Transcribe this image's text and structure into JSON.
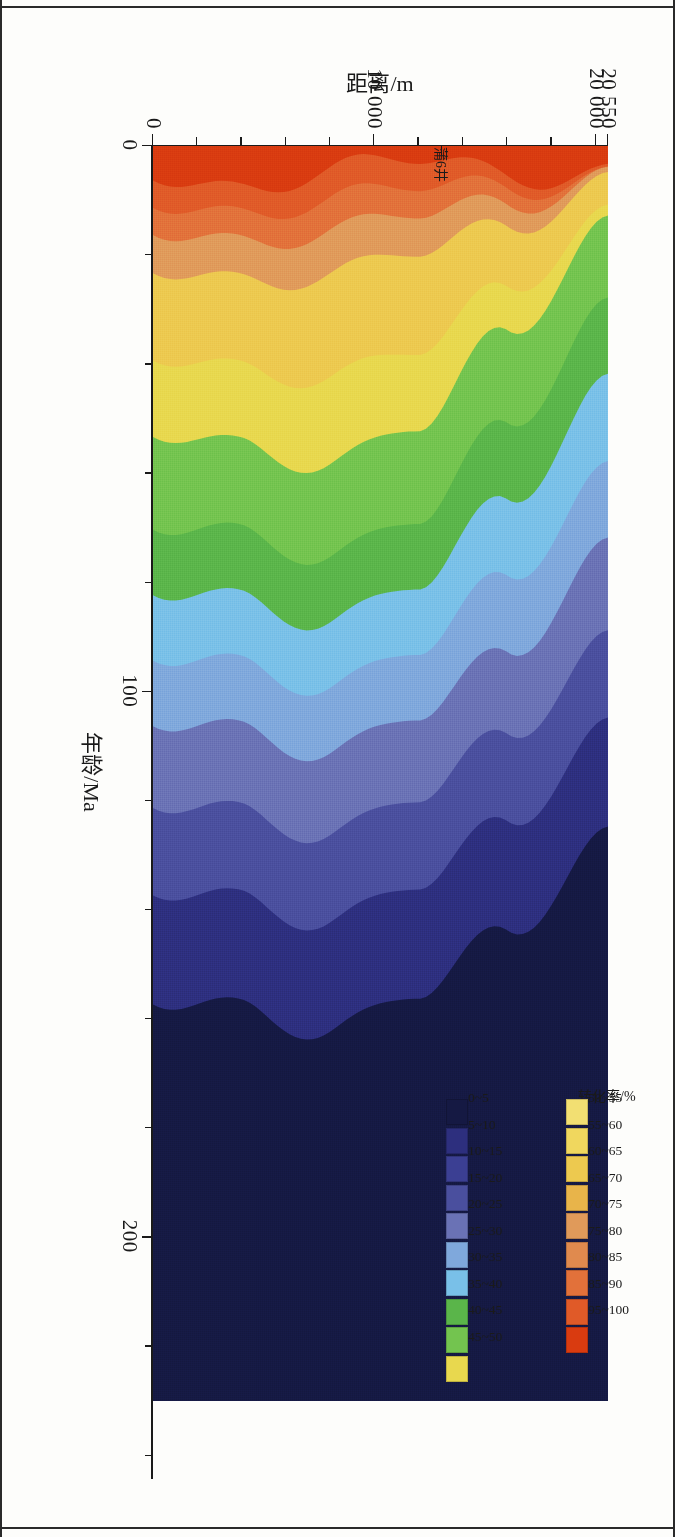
{
  "figure": {
    "type": "filled-contour",
    "well_marker_label": "蒲6井"
  },
  "axes": {
    "x": {
      "title": "年龄/Ma",
      "tick_labels": [
        "0",
        "100",
        "200"
      ],
      "tick_values": [
        0,
        100,
        200
      ],
      "range": [
        0,
        230
      ],
      "minor_step": 20
    },
    "y": {
      "title": "距离/m",
      "tick_labels": [
        "0",
        "10 000",
        "20 000",
        "20 550"
      ],
      "tick_values": [
        0,
        10000,
        20000,
        20550
      ],
      "range": [
        0,
        20550
      ],
      "minor_step": 2000
    }
  },
  "legend": {
    "title": "转化率/%",
    "row_top": {
      "labels": [
        "50~55",
        "55~60",
        "60~65",
        "65~70",
        "70~75",
        "75~80",
        "80~85",
        "85~90",
        "95~100"
      ],
      "colors": [
        "#f2df72",
        "#f0d75e",
        "#edc94f",
        "#e8b44a",
        "#e09a5a",
        "#e08a4e",
        "#e2713a",
        "#e05a28",
        "#d93b10"
      ]
    },
    "row_bottom": {
      "labels": [
        "0~5",
        "5~10",
        "10~15",
        "15~20",
        "20~25",
        "25~30",
        "30~35",
        "35~40",
        "40~45",
        "45~50"
      ],
      "colors": [
        "#151943",
        "#2d2f7e",
        "#3b3f93",
        "#4a4f9e",
        "#6a72b5",
        "#7fa8dc",
        "#79c0e8",
        "#5ab54a",
        "#73c44f",
        "#e8d84e"
      ]
    }
  },
  "chart_data": {
    "type": "heatmap",
    "title": "",
    "xlabel": "年龄/Ma",
    "ylabel": "距离/m",
    "zlabel": "转化率/%",
    "xlim": [
      0,
      230
    ],
    "ylim": [
      0,
      20550
    ],
    "grid": false,
    "legend_position": "top-right",
    "contour_levels": [
      0,
      5,
      10,
      15,
      20,
      25,
      30,
      35,
      40,
      45,
      50,
      55,
      60,
      65,
      70,
      75,
      80,
      85,
      90,
      95,
      100
    ],
    "level_colors": [
      "#151943",
      "#2d2f7e",
      "#3b3f93",
      "#4a4f9e",
      "#6a72b5",
      "#7fa8dc",
      "#79c0e8",
      "#5ab54a",
      "#73c44f",
      "#e8d84e",
      "#f2df72",
      "#f0d75e",
      "#edc94f",
      "#e8b44a",
      "#e09a5a",
      "#e08a4e",
      "#e2713a",
      "#e05a28",
      "#d93b10"
    ],
    "bands": [
      {
        "level": "95~100",
        "color": "#d93b10",
        "x_center_at_y": [
          [
            0,
            2.5
          ],
          [
            4000,
            2.0
          ],
          [
            8000,
            3.0
          ],
          [
            12000,
            2.5
          ],
          [
            16000,
            1.2
          ],
          [
            20550,
            0.0
          ]
        ],
        "half_width": 2.5
      },
      {
        "level": "85~90",
        "color": "#e05a28",
        "x_center_at_y": [
          [
            0,
            7
          ],
          [
            4000,
            6
          ],
          [
            8000,
            8
          ],
          [
            12000,
            7
          ],
          [
            16000,
            3
          ],
          [
            20550,
            0
          ]
        ],
        "half_width": 3
      },
      {
        "level": "80~85",
        "color": "#e2713a",
        "x_center_at_y": [
          [
            0,
            12
          ],
          [
            4000,
            11
          ],
          [
            8000,
            14
          ],
          [
            12000,
            12
          ],
          [
            16000,
            6
          ],
          [
            20550,
            0
          ]
        ],
        "half_width": 3
      },
      {
        "level": "70~80",
        "color": "#e09a5a",
        "x_center_at_y": [
          [
            0,
            18
          ],
          [
            4000,
            17
          ],
          [
            8000,
            21
          ],
          [
            12000,
            18
          ],
          [
            16000,
            9
          ],
          [
            20550,
            0
          ]
        ],
        "half_width": 4
      },
      {
        "level": "50~70",
        "color": "#edc94f",
        "x_center_at_y": [
          [
            0,
            30
          ],
          [
            4000,
            29
          ],
          [
            8000,
            36
          ],
          [
            12000,
            32
          ],
          [
            16000,
            16
          ],
          [
            20550,
            2
          ]
        ],
        "half_width": 8
      },
      {
        "level": "45~50",
        "color": "#e8d84e",
        "x_center_at_y": [
          [
            0,
            44
          ],
          [
            4000,
            43
          ],
          [
            8000,
            52
          ],
          [
            12000,
            46
          ],
          [
            16000,
            24
          ],
          [
            20550,
            4
          ]
        ],
        "half_width": 8
      },
      {
        "level": "35~45",
        "color": "#73c44f",
        "x_center_at_y": [
          [
            0,
            60
          ],
          [
            4000,
            58
          ],
          [
            8000,
            68
          ],
          [
            12000,
            62
          ],
          [
            16000,
            40
          ],
          [
            20550,
            18
          ]
        ],
        "half_width": 9
      },
      {
        "level": "30~35",
        "color": "#5ab54a",
        "x_center_at_y": [
          [
            0,
            74
          ],
          [
            4000,
            72
          ],
          [
            8000,
            82
          ],
          [
            12000,
            76
          ],
          [
            16000,
            56
          ],
          [
            20550,
            34
          ]
        ],
        "half_width": 7
      },
      {
        "level": "25~30",
        "color": "#79c0e8",
        "x_center_at_y": [
          [
            0,
            86
          ],
          [
            4000,
            84
          ],
          [
            8000,
            94
          ],
          [
            12000,
            88
          ],
          [
            16000,
            70
          ],
          [
            20550,
            50
          ]
        ],
        "half_width": 7
      },
      {
        "level": "20~25",
        "color": "#7fa8dc",
        "x_center_at_y": [
          [
            0,
            98
          ],
          [
            4000,
            96
          ],
          [
            8000,
            106
          ],
          [
            12000,
            100
          ],
          [
            16000,
            84
          ],
          [
            20550,
            64
          ]
        ],
        "half_width": 7
      },
      {
        "level": "15~20",
        "color": "#6a72b5",
        "x_center_at_y": [
          [
            0,
            112
          ],
          [
            4000,
            110
          ],
          [
            8000,
            120
          ],
          [
            12000,
            114
          ],
          [
            16000,
            98
          ],
          [
            20550,
            80
          ]
        ],
        "half_width": 8
      },
      {
        "level": "10~15",
        "color": "#4a4f9e",
        "x_center_at_y": [
          [
            0,
            128
          ],
          [
            4000,
            126
          ],
          [
            8000,
            136
          ],
          [
            12000,
            130
          ],
          [
            16000,
            114
          ],
          [
            20550,
            96
          ]
        ],
        "half_width": 8
      },
      {
        "level": "5~10",
        "color": "#2d2f7e",
        "x_center_at_y": [
          [
            0,
            146
          ],
          [
            4000,
            144
          ],
          [
            8000,
            154
          ],
          [
            12000,
            148
          ],
          [
            16000,
            132
          ],
          [
            20550,
            114
          ]
        ],
        "half_width": 10
      },
      {
        "level": "0~5",
        "color": "#151943",
        "x_center_at_y": [
          [
            0,
            200
          ],
          [
            20550,
            195
          ]
        ],
        "half_width": 45
      }
    ]
  }
}
